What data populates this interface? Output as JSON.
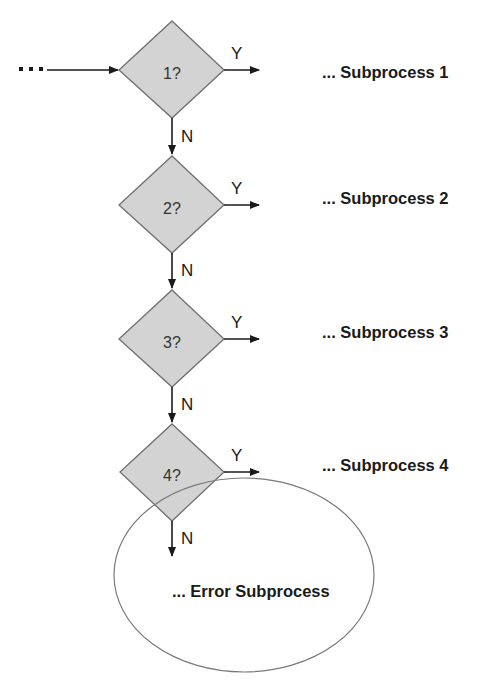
{
  "diagram": {
    "type": "flowchart",
    "colors": {
      "diamond_fill": "#d3d3d3",
      "diamond_stroke": "#707070",
      "line": "#1a1a1a",
      "ellipse_stroke": "#7a7a7a"
    },
    "entry": {
      "ellipsis": "..."
    },
    "decisions": [
      {
        "label": "1?",
        "yes": "Y",
        "no": "N",
        "target": "... Subprocess 1"
      },
      {
        "label": "2?",
        "yes": "Y",
        "no": "N",
        "target": "... Subprocess 2"
      },
      {
        "label": "3?",
        "yes": "Y",
        "no": "N",
        "target": "... Subprocess 3"
      },
      {
        "label": "4?",
        "yes": "Y",
        "no": "N",
        "target": "... Subprocess 4"
      }
    ],
    "error": {
      "label": "... Error Subprocess"
    }
  }
}
